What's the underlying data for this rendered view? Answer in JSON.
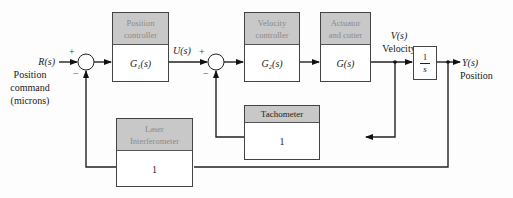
{
  "input": {
    "signal": "R(s)",
    "desc_lines": [
      "Position",
      "command",
      "(microns)"
    ]
  },
  "output": {
    "signal": "Y(s)",
    "desc": "Position"
  },
  "u_signal": "U(s)",
  "velocity": {
    "signal": "V(s)",
    "desc": "Velocity"
  },
  "blocks": {
    "position_controller": {
      "title_lines": [
        "Position",
        "controller"
      ],
      "tf": "G₁(s)"
    },
    "velocity_controller": {
      "title_lines": [
        "Velocity",
        "controller"
      ],
      "tf": "G₂(s)"
    },
    "actuator": {
      "title_lines": [
        "Actuator",
        "and cutter"
      ],
      "tf": "G(s)"
    },
    "integrator": {
      "num": "1",
      "den": "s"
    },
    "tachometer": {
      "title": "Tachometer",
      "tf": "1"
    },
    "laser": {
      "title_lines": [
        "Laser",
        "Interferometer"
      ],
      "tf": "1"
    }
  },
  "summing_junction_1": {
    "plus": "+",
    "minus": "−"
  },
  "summing_junction_2": {
    "plus": "+",
    "minus": "−"
  }
}
